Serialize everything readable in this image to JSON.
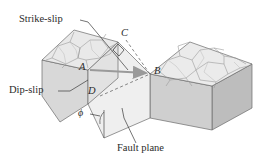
{
  "figure": {
    "title_hidden": "",
    "callouts": [
      {
        "id": "strike-slip",
        "text": "Strike-slip"
      },
      {
        "id": "dip-slip",
        "text": "Dip-slip"
      },
      {
        "id": "fault-plane",
        "text": "Fault plane"
      }
    ],
    "point_labels": [
      {
        "id": "a",
        "text": "A"
      },
      {
        "id": "b",
        "text": "B"
      },
      {
        "id": "c",
        "text": "C"
      },
      {
        "id": "d",
        "text": "D"
      }
    ],
    "angle_labels": [
      {
        "id": "phi",
        "text": "ϕ"
      }
    ],
    "colors": {
      "ink": "#2b2b2b",
      "outline": "#4a4a4a",
      "faint_outline": "#8c8c8c",
      "top_face": "#e9e9e9",
      "front_face": "#d8d8d8",
      "side_face": "#c6c6c6",
      "fault_face": "#efefef",
      "right_top_face": "#ebebeb",
      "right_front_face": "#cfcfcf",
      "right_side_face": "#bdbdbd",
      "arrow": "#9a9a9a",
      "background": "#ffffff"
    }
  }
}
